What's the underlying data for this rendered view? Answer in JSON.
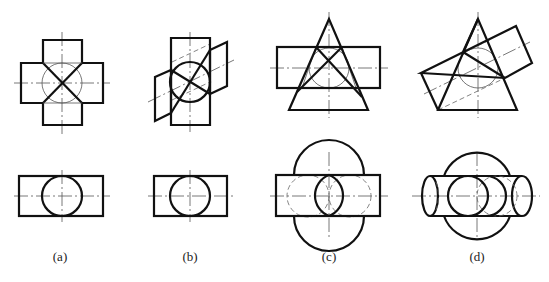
{
  "figure": {
    "panels": [
      {
        "id": "a",
        "label": "(a)",
        "subject": "cylinder intersecting cylinder of equal diameter, axes perpendicular"
      },
      {
        "id": "b",
        "label": "(b)",
        "subject": "cylinder intersecting cylinder of equal diameter, axes oblique"
      },
      {
        "id": "c",
        "label": "(c)",
        "subject": "cylinder intersecting cone, common inscribed sphere, axes perpendicular"
      },
      {
        "id": "d",
        "label": "(d)",
        "subject": "cylinder intersecting cone, common inscribed sphere, axes oblique"
      }
    ]
  }
}
